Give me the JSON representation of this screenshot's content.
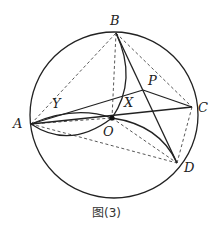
{
  "figure": {
    "caption": "图(3)",
    "points": {
      "A": {
        "label": "A",
        "x": 31,
        "y": 124
      },
      "B": {
        "label": "B",
        "x": 116,
        "y": 33
      },
      "C": {
        "label": "C",
        "x": 192,
        "y": 107
      },
      "D": {
        "label": "D",
        "x": 177,
        "y": 163
      },
      "O": {
        "label": "O",
        "x": 112,
        "y": 118
      },
      "P": {
        "label": "P",
        "x": 143,
        "y": 90
      },
      "X": {
        "label": "X",
        "x": 125,
        "y": 98
      },
      "Y": {
        "label": "Y",
        "x": 64,
        "y": 116
      }
    },
    "circle": {
      "cx": 114,
      "cy": 115,
      "r": 84
    },
    "colors": {
      "stroke": "#222222",
      "background": "#ffffff"
    }
  }
}
